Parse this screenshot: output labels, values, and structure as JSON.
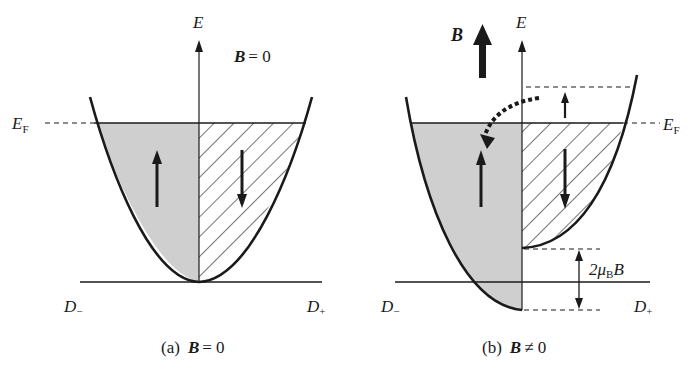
{
  "figure": {
    "panel_a": {
      "axis_label": "E",
      "field_label_symbol": "B",
      "field_label_value": "= 0",
      "fermi_label": "E",
      "fermi_sub": "F",
      "dos_minus_label": "D",
      "dos_minus_sub": "−",
      "dos_plus_label": "D",
      "dos_plus_sub": "+",
      "caption_prefix": "(a)",
      "caption_symbol": "B",
      "caption_value": "= 0"
    },
    "panel_b": {
      "axis_label": "E",
      "field_arrow_label": "B",
      "fermi_label": "E",
      "fermi_sub": "F",
      "splitting_prefix": "2μ",
      "splitting_sub": "B",
      "splitting_suffix": "B",
      "dos_minus_label": "D",
      "dos_minus_sub": "−",
      "dos_plus_label": "D",
      "dos_plus_sub": "+",
      "caption_prefix": "(b)",
      "caption_symbol": "B",
      "caption_value": "≠ 0"
    },
    "colors": {
      "line": "#1a1a1a",
      "spin_up_fill": "#cfcfcf",
      "background": "#ffffff"
    }
  }
}
